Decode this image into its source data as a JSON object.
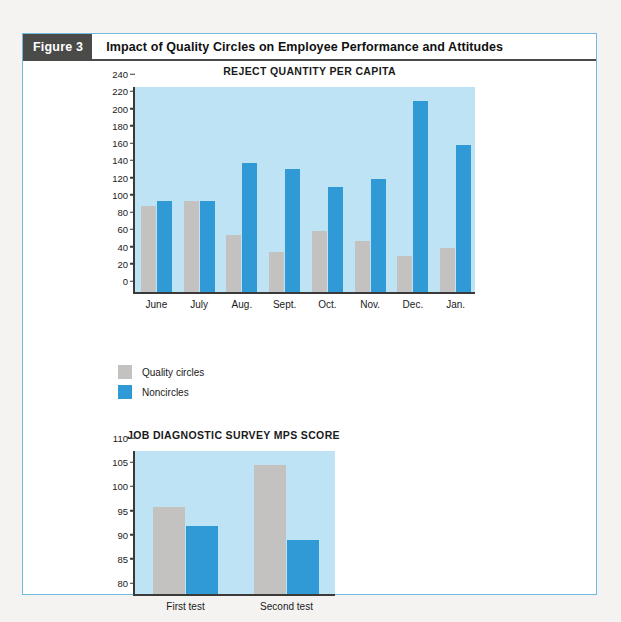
{
  "figure": {
    "tag": "Figure 3",
    "title": "Impact of Quality Circles on Employee Performance and Attitudes"
  },
  "legend": {
    "items": [
      {
        "label": "Quality circles",
        "color": "#c4c2c0",
        "key": "quality_circles"
      },
      {
        "label": "Noncircles",
        "color": "#2f9ad6",
        "key": "noncircles"
      }
    ]
  },
  "colors": {
    "quality_circles": "#c4c2c0",
    "noncircles": "#2f9ad6",
    "plot_background": "#bde3f5",
    "frame_border": "#6fbbe0",
    "axis": "#3a3a38",
    "tag_background": "#4a4a48"
  },
  "chart_data": [
    {
      "id": "reject-quantity-per-capita",
      "type": "bar",
      "title": "REJECT QUANTITY PER CAPITA",
      "xlabel": "",
      "ylabel": "",
      "ylim": [
        0,
        240
      ],
      "ystep": 20,
      "grid": false,
      "legend_position": "below-left",
      "categories": [
        "June",
        "July",
        "Aug.",
        "Sept.",
        "Oct.",
        "Nov.",
        "Dec.",
        "Jan."
      ],
      "yticks": [
        0,
        20,
        40,
        60,
        80,
        100,
        120,
        140,
        160,
        180,
        200,
        220,
        240
      ],
      "series": [
        {
          "name": "Quality circles",
          "color": "#c4c2c0",
          "values": [
            100,
            106,
            66,
            46,
            71,
            59,
            42,
            51
          ]
        },
        {
          "name": "Noncircles",
          "color": "#2f9ad6",
          "values": [
            105,
            106,
            150,
            143,
            122,
            131,
            221,
            171
          ]
        }
      ]
    },
    {
      "id": "job-diagnostic-survey-mps-score",
      "type": "bar",
      "title": "JOB DIAGNOSTIC SURVEY MPS SCORE",
      "xlabel": "",
      "ylabel": "",
      "ylim": [
        80,
        110
      ],
      "ystep": 5,
      "grid": false,
      "legend_position": "none",
      "categories": [
        "First test",
        "Second test"
      ],
      "yticks": [
        80,
        85,
        90,
        95,
        100,
        105,
        110
      ],
      "series": [
        {
          "name": "Quality circles",
          "color": "#c4c2c0",
          "values": [
            98,
            106.7
          ]
        },
        {
          "name": "Noncircles",
          "color": "#2f9ad6",
          "values": [
            94,
            91.2
          ]
        }
      ]
    }
  ]
}
